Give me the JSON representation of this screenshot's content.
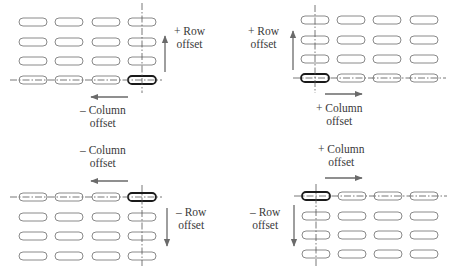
{
  "figure": {
    "colors": {
      "pill_stroke": "#8a8a8a",
      "pill_highlight_stroke": "#1a1a1a",
      "axis_line": "#555555",
      "arrow": "#6a6a6a",
      "text": "#3a3a3a"
    },
    "grid": {
      "rows": 4,
      "columns": 4
    },
    "quadrants": [
      {
        "id": "top-left",
        "reference": "bottom-right slot",
        "row_label": {
          "line1": "+ Row",
          "line2": "offset"
        },
        "column_label": {
          "line1": "– Column",
          "line2": "offset"
        },
        "row_direction": "up",
        "column_direction": "left"
      },
      {
        "id": "top-right",
        "reference": "bottom-left slot",
        "row_label": {
          "line1": "+ Row",
          "line2": "offset"
        },
        "column_label": {
          "line1": "+ Column",
          "line2": "offset"
        },
        "row_direction": "up",
        "column_direction": "right"
      },
      {
        "id": "bottom-left",
        "reference": "top-right slot",
        "row_label": {
          "line1": "– Row",
          "line2": "offset"
        },
        "column_label": {
          "line1": "– Column",
          "line2": "offset"
        },
        "row_direction": "down",
        "column_direction": "left"
      },
      {
        "id": "bottom-right",
        "reference": "top-left slot",
        "row_label": {
          "line1": "– Row",
          "line2": "offset"
        },
        "column_label": {
          "line1": "+ Column",
          "line2": "offset"
        },
        "row_direction": "down",
        "column_direction": "right"
      }
    ]
  }
}
